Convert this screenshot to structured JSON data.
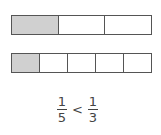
{
  "bars": [
    {
      "parts": 3,
      "shaded": 1,
      "label": "one third"
    },
    {
      "parts": 5,
      "shaded": 1,
      "label": "one fifth"
    }
  ],
  "comparison": {
    "left": {
      "numerator": "1",
      "denominator": "5"
    },
    "operator": "<",
    "right": {
      "numerator": "1",
      "denominator": "3"
    }
  },
  "colors": {
    "shaded": "#d0d0d0",
    "border": "#555555"
  }
}
